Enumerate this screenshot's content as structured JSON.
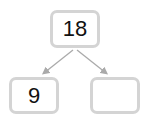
{
  "diagram": {
    "type": "number-bond",
    "top": {
      "value": "18"
    },
    "bottom_left": {
      "value": "9"
    },
    "bottom_right": {
      "value": ""
    },
    "colors": {
      "border": "#d4d4d4",
      "arrow": "#aaaaaa",
      "text": "#111111"
    }
  }
}
